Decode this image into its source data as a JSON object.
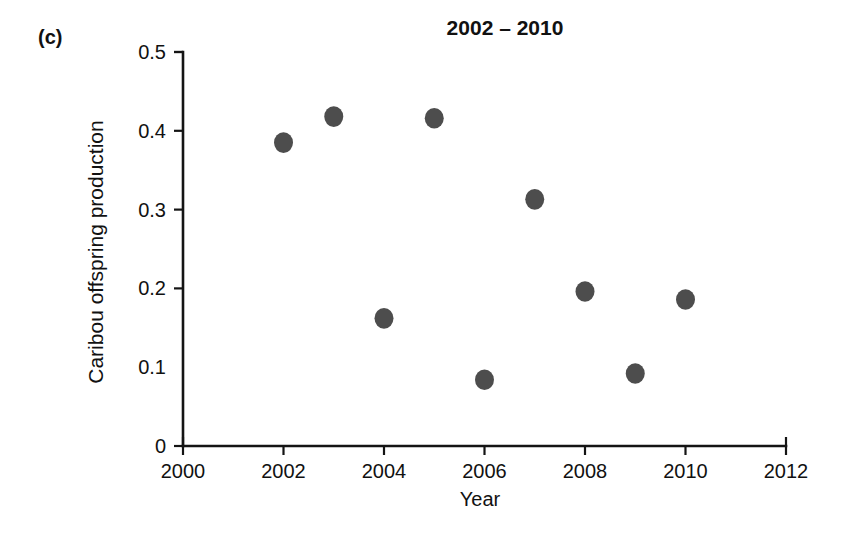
{
  "figure": {
    "panel_label": "(c)",
    "title": "2002 – 2010",
    "background_color": "#ffffff"
  },
  "chart_data": {
    "type": "scatter",
    "title": "2002 – 2010",
    "xlabel": "Year",
    "ylabel": "Caribou offspring production",
    "xlim": [
      2000,
      2012
    ],
    "ylim": [
      0,
      0.5
    ],
    "grid": false,
    "legend": null,
    "marker": {
      "shape": "circle",
      "color": "#4d4d4d",
      "size_px": 19
    },
    "x_ticks": [
      2000,
      2002,
      2004,
      2006,
      2008,
      2010,
      2012
    ],
    "x_tick_labels": [
      "2000",
      "2002",
      "2004",
      "2006",
      "2008",
      "2010",
      "2012"
    ],
    "y_ticks": [
      0,
      0.1,
      0.2,
      0.3,
      0.4,
      0.5
    ],
    "y_tick_labels": [
      "0",
      "0.1",
      "0.2",
      "0.3",
      "0.4",
      "0.5"
    ],
    "x": [
      2002.0,
      2003.0,
      2004.0,
      2005.0,
      2006.0,
      2007.0,
      2008.0,
      2009.0,
      2010.0
    ],
    "y": [
      0.385,
      0.418,
      0.162,
      0.416,
      0.084,
      0.313,
      0.196,
      0.092,
      0.186
    ],
    "points": [
      {
        "x": 2002.0,
        "y": 0.385
      },
      {
        "x": 2003.0,
        "y": 0.418
      },
      {
        "x": 2004.0,
        "y": 0.162
      },
      {
        "x": 2005.0,
        "y": 0.416
      },
      {
        "x": 2006.0,
        "y": 0.084
      },
      {
        "x": 2007.0,
        "y": 0.313
      },
      {
        "x": 2008.0,
        "y": 0.196
      },
      {
        "x": 2009.0,
        "y": 0.092
      },
      {
        "x": 2010.0,
        "y": 0.186
      }
    ]
  },
  "axes_geometry": {
    "plot_left_px": 183,
    "plot_right_px": 786,
    "plot_top_px": 52,
    "plot_bottom_px": 446
  }
}
